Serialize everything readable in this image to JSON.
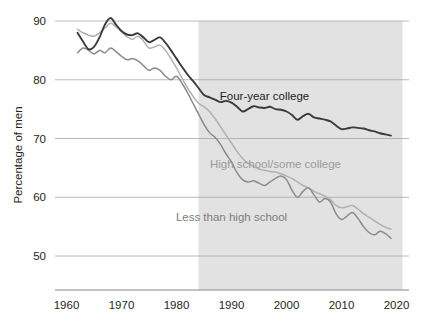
{
  "chart_data": {
    "type": "line",
    "title": "",
    "xlabel": "",
    "ylabel": "Percentage of men",
    "xlim": [
      1960,
      2020
    ],
    "ylim": [
      45,
      92
    ],
    "grid": true,
    "gridlines_y": [
      50,
      60,
      70,
      80,
      90
    ],
    "xticks": [
      1960,
      1970,
      1980,
      1990,
      2000,
      2010,
      2020
    ],
    "xtick_labels": [
      "1960",
      "1970",
      "1980",
      "1990",
      "2000",
      "2010",
      "2020"
    ],
    "yticks": [
      50,
      60,
      70,
      80,
      90
    ],
    "ytick_labels": [
      "50",
      "60",
      "70",
      "80",
      "90"
    ],
    "legend_position": "inline-annotations",
    "shaded_region": {
      "x_start": 1984,
      "x_end": 2020,
      "color": "#e2e2e2"
    },
    "colors": {
      "four_year_college": "#3a3a3a",
      "high_school_some_college": "#b0b0b0",
      "less_than_high_school": "#8a8a8a",
      "gridline": "#a8a8a8",
      "axis": "#7a7a7a",
      "text": "#231f20",
      "shading": "#e2e2e2"
    },
    "annotations": [
      {
        "text": "Four-year college",
        "x": 1996,
        "y": 76.5,
        "color": "#231f20"
      },
      {
        "text": "High school/some college",
        "x": 1998,
        "y": 65.0,
        "color": "#9a9a9a"
      },
      {
        "text": "Less than high school",
        "x": 1990,
        "y": 56.0,
        "color": "#7d7d7d"
      }
    ],
    "series": [
      {
        "name": "Four-year college",
        "color": "#3a3a3a",
        "x": [
          1962,
          1963,
          1964,
          1965,
          1966,
          1967,
          1968,
          1969,
          1970,
          1971,
          1972,
          1973,
          1974,
          1975,
          1976,
          1977,
          1978,
          1979,
          1980,
          1981,
          1982,
          1983,
          1984,
          1985,
          1986,
          1987,
          1988,
          1989,
          1990,
          1991,
          1992,
          1993,
          1994,
          1995,
          1996,
          1997,
          1998,
          1999,
          2000,
          2001,
          2002,
          2003,
          2004,
          2005,
          2006,
          2007,
          2008,
          2009,
          2010,
          2011,
          2012,
          2013,
          2014,
          2015,
          2016,
          2017,
          2018,
          2019
        ],
        "values": [
          88.0,
          86.5,
          85.2,
          85.6,
          87.2,
          89.4,
          90.5,
          89.4,
          88.3,
          87.7,
          87.6,
          87.9,
          87.2,
          86.4,
          86.8,
          87.2,
          86.3,
          85.0,
          83.6,
          82.2,
          80.9,
          79.8,
          78.6,
          77.4,
          77.0,
          76.6,
          76.2,
          76.4,
          76.1,
          75.4,
          74.6,
          75.0,
          75.5,
          75.3,
          75.2,
          75.4,
          75.0,
          74.9,
          74.6,
          74.0,
          73.2,
          73.8,
          74.2,
          73.6,
          73.4,
          73.2,
          72.9,
          72.2,
          71.6,
          71.7,
          71.9,
          71.8,
          71.7,
          71.4,
          71.2,
          70.9,
          70.7,
          70.5
        ]
      },
      {
        "name": "High school/some college",
        "color": "#b0b0b0",
        "x": [
          1962,
          1963,
          1964,
          1965,
          1966,
          1967,
          1968,
          1969,
          1970,
          1971,
          1972,
          1973,
          1974,
          1975,
          1976,
          1977,
          1978,
          1979,
          1980,
          1981,
          1982,
          1983,
          1984,
          1985,
          1986,
          1987,
          1988,
          1989,
          1990,
          1991,
          1992,
          1993,
          1994,
          1995,
          1996,
          1997,
          1998,
          1999,
          2000,
          2001,
          2002,
          2003,
          2004,
          2005,
          2006,
          2007,
          2008,
          2009,
          2010,
          2011,
          2012,
          2013,
          2014,
          2015,
          2016,
          2017,
          2018,
          2019
        ],
        "values": [
          88.6,
          88.0,
          87.6,
          87.4,
          88.0,
          88.8,
          89.6,
          89.0,
          88.2,
          87.3,
          86.9,
          87.4,
          86.6,
          85.4,
          85.6,
          85.9,
          85.0,
          83.6,
          82.0,
          80.3,
          78.6,
          77.2,
          76.0,
          75.4,
          74.6,
          73.4,
          72.0,
          70.6,
          69.2,
          67.8,
          66.6,
          65.8,
          65.2,
          64.8,
          64.6,
          64.4,
          64.3,
          64.0,
          63.6,
          63.2,
          62.6,
          62.0,
          61.6,
          61.0,
          60.6,
          60.2,
          59.6,
          58.6,
          58.2,
          58.4,
          58.6,
          58.0,
          57.2,
          56.6,
          56.0,
          55.4,
          54.9,
          54.6
        ]
      },
      {
        "name": "Less than high school",
        "color": "#8a8a8a",
        "x": [
          1962,
          1963,
          1964,
          1965,
          1966,
          1967,
          1968,
          1969,
          1970,
          1971,
          1972,
          1973,
          1974,
          1975,
          1976,
          1977,
          1978,
          1979,
          1980,
          1981,
          1982,
          1983,
          1984,
          1985,
          1986,
          1987,
          1988,
          1989,
          1990,
          1991,
          1992,
          1993,
          1994,
          1995,
          1996,
          1997,
          1998,
          1999,
          2000,
          2001,
          2002,
          2003,
          2004,
          2005,
          2006,
          2007,
          2008,
          2009,
          2010,
          2011,
          2012,
          2013,
          2014,
          2015,
          2016,
          2017,
          2018,
          2019
        ],
        "values": [
          84.6,
          85.4,
          85.0,
          84.4,
          85.0,
          84.6,
          85.4,
          84.8,
          84.0,
          83.4,
          83.6,
          83.2,
          82.4,
          81.6,
          82.0,
          81.6,
          80.6,
          80.0,
          80.6,
          79.4,
          77.8,
          76.0,
          74.2,
          72.4,
          71.0,
          70.2,
          69.0,
          67.4,
          66.0,
          64.2,
          63.0,
          62.6,
          62.8,
          62.4,
          62.0,
          62.6,
          63.2,
          63.6,
          63.0,
          61.2,
          60.0,
          61.0,
          61.6,
          60.4,
          59.2,
          59.8,
          59.2,
          57.2,
          56.2,
          56.8,
          57.4,
          56.4,
          55.0,
          54.0,
          53.6,
          54.2,
          53.8,
          53.0
        ]
      }
    ]
  }
}
